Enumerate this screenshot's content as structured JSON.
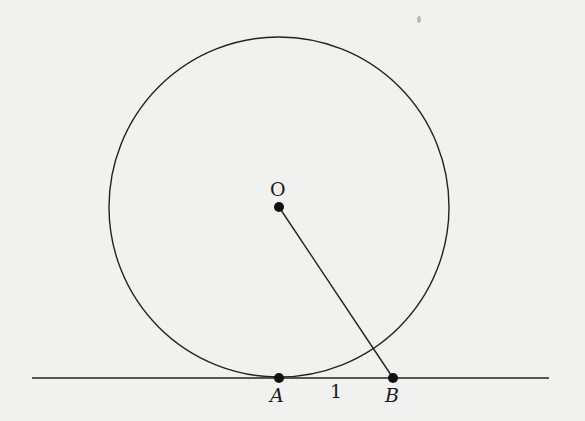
{
  "diagram": {
    "type": "geometry",
    "colors": {
      "background": "#f1f1ef",
      "stroke": "#222222"
    },
    "circle": {
      "center_label": "O",
      "cx": 279,
      "cy": 207,
      "r": 170
    },
    "tangent_line": {
      "x1": 32,
      "x2": 549,
      "y": 378
    },
    "points": [
      {
        "id": "O",
        "label": "O",
        "x": 279,
        "y": 207
      },
      {
        "id": "A",
        "label": "A",
        "x": 279,
        "y": 378
      },
      {
        "id": "B",
        "label": "B",
        "x": 393,
        "y": 378
      }
    ],
    "segments": [
      {
        "from": "O",
        "to": "B"
      }
    ],
    "annotations": {
      "AB_length": "1"
    }
  }
}
